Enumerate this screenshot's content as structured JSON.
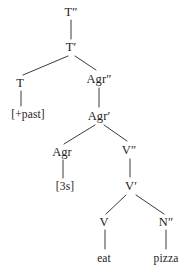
{
  "figure": {
    "kind": "syntax-tree",
    "sentence": "eat pizza",
    "background_color": "#ffffff",
    "line_color": "#3a3a3a",
    "text_color": "#1d1d1d"
  },
  "nodes": [
    {
      "id": "t2",
      "label": "T″",
      "x": 71,
      "y": 12,
      "type": "phrase"
    },
    {
      "id": "t1",
      "label": "T′",
      "x": 71,
      "y": 47,
      "type": "bar"
    },
    {
      "id": "t0",
      "label": "T",
      "x": 20,
      "y": 83,
      "type": "head"
    },
    {
      "id": "past",
      "label": "[+past]",
      "x": 28,
      "y": 114,
      "type": "feature"
    },
    {
      "id": "agr2",
      "label": "Agr″",
      "x": 99,
      "y": 79,
      "type": "phrase"
    },
    {
      "id": "agr1",
      "label": "Agr′",
      "x": 99,
      "y": 116,
      "type": "bar"
    },
    {
      "id": "agr0",
      "label": "Agr",
      "x": 62,
      "y": 152,
      "type": "head"
    },
    {
      "id": "3s",
      "label": "[3s]",
      "x": 65,
      "y": 186,
      "type": "feature"
    },
    {
      "id": "v2",
      "label": "V″",
      "x": 129,
      "y": 150,
      "type": "phrase"
    },
    {
      "id": "v1",
      "label": "V′",
      "x": 131,
      "y": 186,
      "type": "bar"
    },
    {
      "id": "v0",
      "label": "V",
      "x": 104,
      "y": 222,
      "type": "head"
    },
    {
      "id": "eat",
      "label": "eat",
      "x": 104,
      "y": 258,
      "type": "terminal"
    },
    {
      "id": "n2",
      "label": "N″",
      "x": 166,
      "y": 222,
      "type": "phrase"
    },
    {
      "id": "pizza",
      "label": "pizza",
      "x": 166,
      "y": 258,
      "type": "terminal"
    }
  ],
  "edges": [
    {
      "from": "t2",
      "to": "t1",
      "x1": 71,
      "y1": 20,
      "x2": 71,
      "y2": 39
    },
    {
      "from": "t1",
      "to": "t0",
      "x1": 68,
      "y1": 56,
      "x2": 23,
      "y2": 75
    },
    {
      "from": "t1",
      "to": "agr2",
      "x1": 75,
      "y1": 56,
      "x2": 96,
      "y2": 70
    },
    {
      "from": "t0",
      "to": "past",
      "x1": 21,
      "y1": 91,
      "x2": 21,
      "y2": 106
    },
    {
      "from": "agr2",
      "to": "agr1",
      "x1": 99,
      "y1": 88,
      "x2": 99,
      "y2": 107
    },
    {
      "from": "agr1",
      "to": "agr0",
      "x1": 95,
      "y1": 125,
      "x2": 64,
      "y2": 144
    },
    {
      "from": "agr1",
      "to": "v2",
      "x1": 104,
      "y1": 125,
      "x2": 127,
      "y2": 141
    },
    {
      "from": "agr0",
      "to": "3s",
      "x1": 63,
      "y1": 160,
      "x2": 63,
      "y2": 178
    },
    {
      "from": "v2",
      "to": "v1",
      "x1": 130,
      "y1": 159,
      "x2": 130,
      "y2": 177
    },
    {
      "from": "v1",
      "to": "v0",
      "x1": 126,
      "y1": 195,
      "x2": 106,
      "y2": 214
    },
    {
      "from": "v1",
      "to": "n2",
      "x1": 136,
      "y1": 195,
      "x2": 164,
      "y2": 214
    },
    {
      "from": "v0",
      "to": "eat",
      "x1": 105,
      "y1": 230,
      "x2": 105,
      "y2": 249
    },
    {
      "from": "n2",
      "to": "pizza",
      "x1": 166,
      "y1": 230,
      "x2": 166,
      "y2": 249
    }
  ]
}
